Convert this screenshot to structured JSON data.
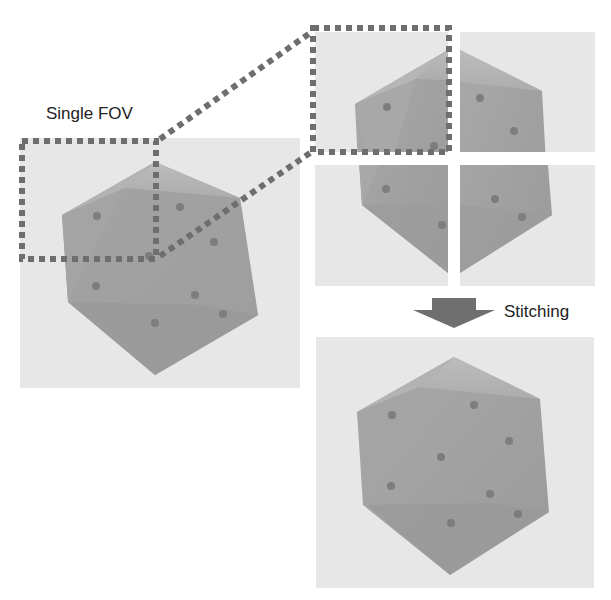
{
  "labels": {
    "single_fov": "Single FOV",
    "stitching": "Stitching"
  },
  "colors": {
    "background": "#ffffff",
    "panel": "#e7e7e7",
    "polyhedron_face": "#a3a3a3",
    "polyhedron_light": "#bdbdbd",
    "polyhedron_dark": "#959595",
    "dot": "#7d7d7d",
    "dashed_border": "#6e6e6e",
    "arrow": "#6f6f6f"
  },
  "panels": [
    {
      "name": "single-fov-image",
      "x": 20,
      "y": 138,
      "w": 280,
      "h": 250
    },
    {
      "name": "tile-top-left",
      "x": 315,
      "y": 32,
      "w": 133,
      "h": 120
    },
    {
      "name": "tile-top-right",
      "x": 460,
      "y": 32,
      "w": 135,
      "h": 120
    },
    {
      "name": "tile-bottom-left",
      "x": 315,
      "y": 165,
      "w": 133,
      "h": 121
    },
    {
      "name": "tile-bottom-right",
      "x": 460,
      "y": 165,
      "w": 135,
      "h": 121
    },
    {
      "name": "stitched-image",
      "x": 316,
      "y": 337,
      "w": 278,
      "h": 251
    }
  ]
}
